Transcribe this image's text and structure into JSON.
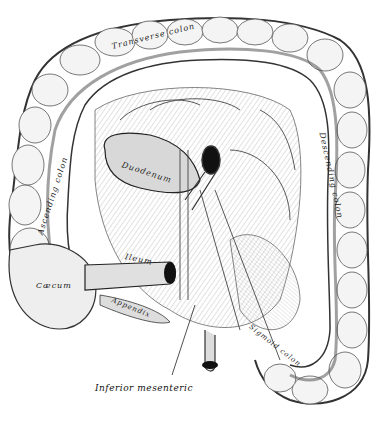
{
  "figure": {
    "type": "anatomical-illustration",
    "background": "#ffffff",
    "ink": "#222222",
    "labels": {
      "transverse_colon": "Transverse colon",
      "ascending_colon": "Ascending colon",
      "descending_colon": "Descending colon",
      "duodenum": "Duodenum",
      "ileum": "Ileum",
      "caecum": "Cæcum",
      "appendix": "Appendix",
      "sigmoid_colon": "Sigmoid colon",
      "inferior_mesenteric": "Inferior mesenteric"
    }
  }
}
